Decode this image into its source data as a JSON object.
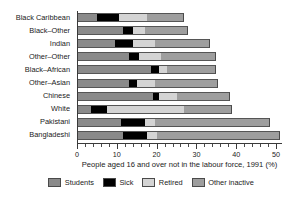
{
  "chart_data": {
    "type": "bar",
    "orientation": "horizontal",
    "stacked": true,
    "title": "",
    "xlabel": "People aged 16 and over not in the labour force, 1991 (%)",
    "ylabel": "",
    "xlim": [
      0,
      51.5
    ],
    "xticks": [
      0,
      10,
      20,
      30,
      40,
      50
    ],
    "xticklabels": [
      "0",
      "10",
      "20",
      "30",
      "40",
      "50"
    ],
    "minor_tick_interval": 2,
    "grid": false,
    "legend_position": "bottom",
    "categories": [
      "Black Caribbean",
      "Black–Other",
      "Indian",
      "Other–Other",
      "Black–African",
      "Other–Asian",
      "Chinese",
      "White",
      "Pakistani",
      "Bangladeshi"
    ],
    "series": [
      {
        "name": "Students",
        "color": "#8a8a8a",
        "values": [
          5.0,
          11.5,
          9.5,
          13.0,
          18.5,
          13.0,
          19.0,
          3.5,
          11.0,
          11.5
        ]
      },
      {
        "name": "Sick",
        "color": "#000000",
        "values": [
          5.5,
          2.5,
          4.5,
          2.5,
          2.0,
          2.0,
          1.5,
          4.0,
          6.0,
          6.0
        ]
      },
      {
        "name": "Retired",
        "color": "#d4d4d4",
        "values": [
          7.0,
          3.0,
          5.5,
          5.5,
          2.0,
          4.5,
          4.5,
          19.5,
          2.5,
          2.5
        ]
      },
      {
        "name": "Other inactive",
        "color": "#9e9e9e",
        "values": [
          9.5,
          11.0,
          14.0,
          14.0,
          12.5,
          16.0,
          13.5,
          12.0,
          29.0,
          31.0
        ]
      }
    ],
    "totals": [
      27.0,
      28.0,
      33.5,
      35.0,
      35.0,
      35.5,
      38.5,
      39.0,
      48.5,
      51.0
    ]
  },
  "legend": {
    "items": [
      {
        "label": "Students",
        "color": "#8a8a8a"
      },
      {
        "label": "Sick",
        "color": "#000000"
      },
      {
        "label": "Retired",
        "color": "#d4d4d4"
      },
      {
        "label": "Other inactive",
        "color": "#9e9e9e"
      }
    ]
  }
}
